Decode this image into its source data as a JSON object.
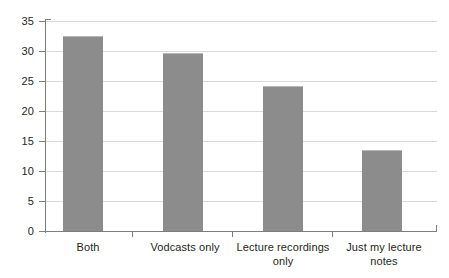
{
  "chart_data": {
    "type": "bar",
    "title": "",
    "subtitle": "",
    "xlabel": "",
    "ylabel": "",
    "categories": [
      "Both",
      "Vodcasts only",
      "Lecture recordings only",
      "Just my lecture notes"
    ],
    "values": [
      32.5,
      29.7,
      24.2,
      13.5
    ],
    "series": [
      {
        "name": "",
        "values": [
          32.5,
          29.7,
          24.2,
          13.5
        ]
      }
    ],
    "ylim": [
      0,
      35
    ],
    "xlim": [
      0,
      4
    ],
    "ytick_labels": [
      "0",
      "5",
      "10",
      "15",
      "20",
      "25",
      "30",
      "35"
    ],
    "ytick_values": [
      0,
      5,
      10,
      15,
      20,
      25,
      30,
      35
    ],
    "grid": "horizontal",
    "legend": "none",
    "bar_color": "#8c8c8c",
    "grid_color": "#d9d9d9",
    "axis_color": "#7d7d7d",
    "background_color": "#ffffff",
    "annotations": []
  },
  "axis": {
    "y_ticks": [
      {
        "label": "35",
        "value": 35
      },
      {
        "label": "30",
        "value": 30
      },
      {
        "label": "25",
        "value": 25
      },
      {
        "label": "20",
        "value": 20
      },
      {
        "label": "15",
        "value": 15
      },
      {
        "label": "10",
        "value": 10
      },
      {
        "label": "5",
        "value": 5
      },
      {
        "label": "0",
        "value": 0
      }
    ],
    "x_categories": [
      {
        "label": "Both",
        "lines": [
          "Both"
        ]
      },
      {
        "label": "Vodcasts only",
        "lines": [
          "Vodcasts only"
        ]
      },
      {
        "label": "Lecture recordings only",
        "lines": [
          "Lecture recordings",
          "only"
        ]
      },
      {
        "label": "Just my lecture notes",
        "lines": [
          "Just my lecture",
          "notes"
        ]
      }
    ]
  }
}
